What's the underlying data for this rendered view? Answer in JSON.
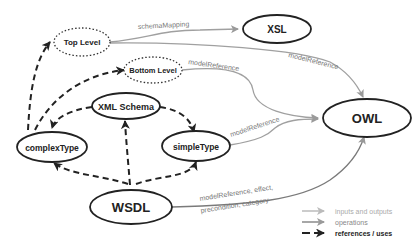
{
  "diagram": {
    "nodes": {
      "top_level": "Top Level",
      "xsl": "XSL",
      "bottom_level": "Bottom Level",
      "xml_schema": "XML Schema",
      "complex_type": "complexType",
      "simple_type": "simpleType",
      "owl": "OWL",
      "wsdl": "WSDL"
    },
    "edges": {
      "schema_mapping": "schemaMapping",
      "model_reference_top": "modelReference",
      "model_reference_bottom": "modelReference",
      "model_reference_simple": "modelReference",
      "wsdl_line1": "modelReference, effect,",
      "wsdl_line2": "precondition, category"
    },
    "legend": {
      "inputs_outputs": "inputs and outputs",
      "operations": "operations",
      "references": "references / uses"
    },
    "colors": {
      "light_arrow": "#b0b0b0",
      "mid_arrow": "#8a8a8a",
      "dashed_arrow": "#222222",
      "node_border": "#222222"
    }
  }
}
